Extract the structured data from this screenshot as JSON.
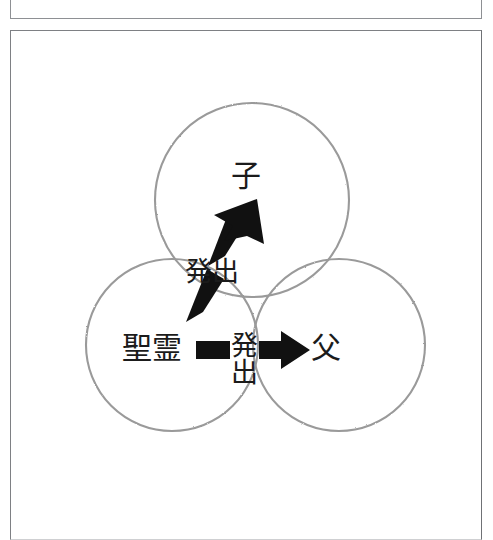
{
  "page": {
    "background_color": "#ffffff",
    "frame_color": "#7e8084",
    "ink_color": "#1b1b1b",
    "circle_stroke_color": "#9a9a9a"
  },
  "figure": {
    "type": "venn-trinity-diagram",
    "nodes": [
      {
        "id": "son",
        "label": "子",
        "reading": "Son",
        "circle": "top"
      },
      {
        "id": "spirit",
        "label": "聖霊",
        "reading": "Holy Spirit",
        "circle": "bottom-left"
      },
      {
        "id": "father",
        "label": "父",
        "reading": "Father",
        "circle": "bottom-right"
      }
    ],
    "arrows": [
      {
        "id": "arrow-diagonal",
        "label": "発出",
        "reading": "procession",
        "from": "spirit",
        "to": "son",
        "orientation": "diagonal-up-right",
        "label_orientation": "horizontal"
      },
      {
        "id": "arrow-horizontal",
        "label": "発出",
        "reading": "procession",
        "from": "spirit",
        "to": "father",
        "orientation": "horizontal-right",
        "label_orientation": "vertical"
      }
    ],
    "circles": [
      {
        "id": "circle-son",
        "cx": 252,
        "cy": 200,
        "r": 97
      },
      {
        "id": "circle-spirit",
        "cx": 172,
        "cy": 345,
        "r": 86
      },
      {
        "id": "circle-father",
        "cx": 339,
        "cy": 345,
        "r": 86
      }
    ]
  }
}
